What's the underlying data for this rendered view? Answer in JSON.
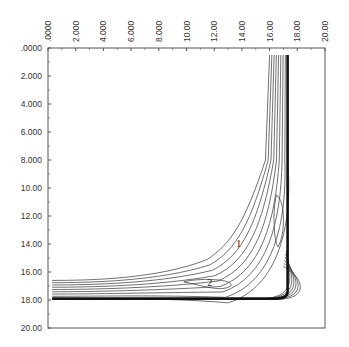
{
  "chart_data": {
    "type": "contour",
    "title": "",
    "xlabel": "",
    "ylabel": "",
    "xlim": [
      0,
      20
    ],
    "ylim": [
      0,
      20
    ],
    "x_axis_position": "top",
    "y_axis_inverted": true,
    "grid": false,
    "x_ticks": [
      ".0000",
      "2.000",
      "4.000",
      "6.000",
      "8.000",
      "10.00",
      "12.00",
      "14.00",
      "16.00",
      "18.00",
      "20.00"
    ],
    "y_ticks": [
      ".0000",
      "2.000",
      "4.000",
      "6.000",
      "8.000",
      "10.00",
      "12.00",
      "14.00",
      "16.00",
      "18.00",
      "20.00"
    ],
    "contour_level_labels": [
      {
        "text": "1",
        "x": 13.6,
        "y": 14.2
      },
      {
        "text": "2",
        "x": 11.5,
        "y": 17.0
      }
    ],
    "features": {
      "vertical_band_x_range": [
        16.0,
        17.3
      ],
      "horizontal_band_y_range": [
        16.6,
        17.9
      ],
      "thick_boundary_x": 17.3,
      "thick_boundary_y": 17.9,
      "description": "L-shaped contour bands along x≈16–17.3 (top to y≈18) and y≈16.6–17.9 (x 0 to ≈17), with a thick dark boundary on the outer edge"
    }
  }
}
